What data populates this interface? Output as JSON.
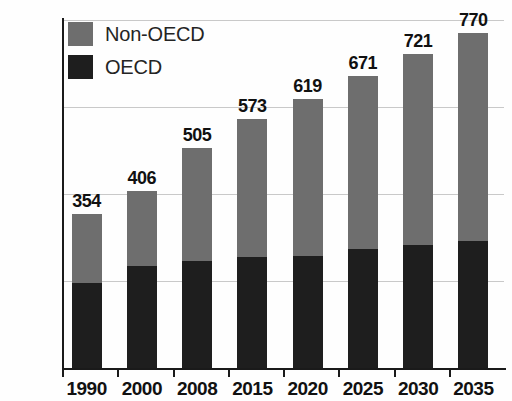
{
  "chart_data": {
    "type": "bar",
    "subtype": "stacked-column",
    "title": "",
    "xlabel": "",
    "ylabel": "",
    "categories": [
      "1990",
      "2000",
      "2008",
      "2015",
      "2020",
      "2025",
      "2030",
      "2035"
    ],
    "totals": [
      354,
      406,
      505,
      573,
      619,
      671,
      721,
      770
    ],
    "series": [
      {
        "name": "OECD",
        "color": "#1e1e1e",
        "values": [
          196,
          234,
          246,
          255,
          258,
          273,
          282,
          291
        ]
      },
      {
        "name": "Non-OECD",
        "color": "#6e6e6e",
        "values": [
          158,
          172,
          259,
          318,
          361,
          398,
          439,
          479
        ]
      }
    ],
    "data_labels": [
      "354",
      "406",
      "505",
      "573",
      "619",
      "671",
      "721",
      "770"
    ],
    "ylim": [
      0,
      800
    ],
    "yticks": [
      0,
      200,
      400,
      600,
      800
    ],
    "ytick_labels": [
      "0",
      "200",
      "400",
      "600",
      "800"
    ],
    "grid": true,
    "grid_axis": "y",
    "legend_position": "top-left",
    "legend": [
      "Non-OECD",
      "OECD"
    ]
  },
  "legend": {
    "items": [
      {
        "label": "Non-OECD",
        "color": "#6e6e6e"
      },
      {
        "label": "OECD",
        "color": "#1e1e1e"
      }
    ]
  },
  "axes": {
    "y": {
      "labels": [
        "800",
        "600",
        "400",
        "200",
        "0"
      ]
    },
    "x": {
      "labels": [
        "1990",
        "2000",
        "2008",
        "2015",
        "2020",
        "2025",
        "2030",
        "2035"
      ]
    }
  }
}
